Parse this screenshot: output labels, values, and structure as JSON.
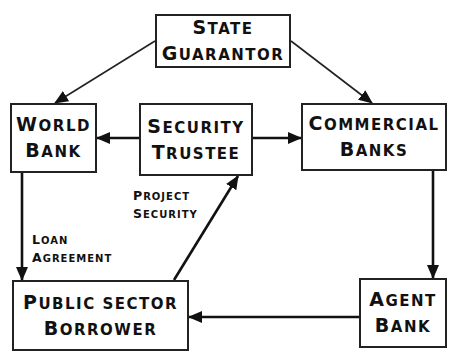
{
  "diagram": {
    "title": "",
    "nodes": {
      "state_guarantor": {
        "lines": [
          "State",
          "Guarantor"
        ]
      },
      "world_bank": {
        "lines": [
          "World",
          "Bank"
        ]
      },
      "security_trustee": {
        "lines": [
          "Security",
          "Trustee"
        ]
      },
      "commercial_banks": {
        "lines": [
          "Commercial",
          "Banks"
        ]
      },
      "public_sector_borrower": {
        "lines": [
          "Public Sector",
          "Borrower"
        ]
      },
      "agent_bank": {
        "lines": [
          "Agent",
          "Bank"
        ]
      }
    },
    "edge_labels": {
      "loan_agreement": {
        "lines": [
          "Loan",
          "Agreement"
        ]
      },
      "project_security": {
        "lines": [
          "Project",
          "Security"
        ]
      }
    },
    "edges": [
      {
        "from": "state_guarantor",
        "to": "world_bank",
        "style": "thin"
      },
      {
        "from": "state_guarantor",
        "to": "commercial_banks",
        "style": "thin"
      },
      {
        "from": "security_trustee",
        "to": "world_bank",
        "style": "thick"
      },
      {
        "from": "security_trustee",
        "to": "commercial_banks",
        "style": "thick"
      },
      {
        "from": "world_bank",
        "to": "public_sector_borrower",
        "style": "thick",
        "label": "loan_agreement"
      },
      {
        "from": "public_sector_borrower",
        "to": "security_trustee",
        "style": "thick",
        "label": "project_security"
      },
      {
        "from": "commercial_banks",
        "to": "agent_bank",
        "style": "thick"
      },
      {
        "from": "agent_bank",
        "to": "public_sector_borrower",
        "style": "thick"
      }
    ],
    "colors": {
      "line": "#222222",
      "text": "#111111",
      "background": "#ffffff"
    }
  }
}
